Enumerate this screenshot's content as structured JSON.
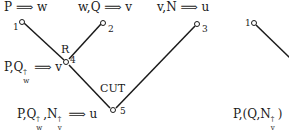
{
  "sequents": {
    "s1": "P ⟹ w",
    "s2": "w,Q ⟹ v",
    "s3": "v,N ⟹ u",
    "s4_prefix": "P,Q",
    "s4_sub": "w",
    "s4_suffix": "⟹ v",
    "s5_prefix": "P,Q",
    "s5_sub1": "w",
    "s5_mid": ",N",
    "s5_sub2": "v",
    "s5_suffix": "⟹ u",
    "s6_prefix": "P,(Q,N",
    "s6_sub": "v",
    "s6_suffix": ")"
  },
  "dagger": "†",
  "rules": {
    "r1": "R",
    "r2": "CUT"
  },
  "nodes": {
    "n1": "1",
    "n2": "2",
    "n3": "3",
    "n4": "4",
    "n5": "5",
    "n1b": "1"
  },
  "colors": {
    "line": "#1a1a1a"
  }
}
